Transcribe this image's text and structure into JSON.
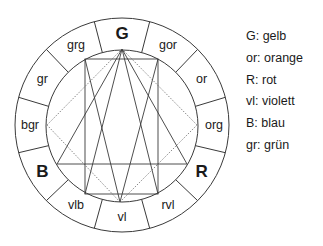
{
  "diagram": {
    "title": "",
    "wheel_segments": [
      "G",
      "gor",
      "or",
      "org",
      "R",
      "rvl",
      "vl",
      "vlb",
      "B",
      "bgr",
      "gr",
      "grg"
    ],
    "primary_segments": [
      "G",
      "R",
      "B"
    ],
    "legend": [
      {
        "key": "G",
        "label": "G: gelb"
      },
      {
        "key": "or",
        "label": "or: orange"
      },
      {
        "key": "R",
        "label": "R: rot"
      },
      {
        "key": "vl",
        "label": "vl: violett"
      },
      {
        "key": "B",
        "label": "B: blau"
      },
      {
        "key": "gr",
        "label": "gr: grün"
      }
    ],
    "colors": {
      "stroke": "#3a3a3a",
      "text": "#1a1a1a",
      "background": "#ffffff"
    }
  }
}
